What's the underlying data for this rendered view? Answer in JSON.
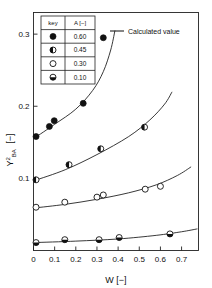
{
  "chart_data": {
    "type": "scatter",
    "title": "",
    "xlabel": "W  [−]",
    "ylabel": "Y²BA  [−]",
    "ylabel_base": "Y",
    "ylabel_sup": "2",
    "ylabel_sub": "BA",
    "ylabel_unit": "[−]",
    "xlim": [
      0,
      0.78
    ],
    "ylim": [
      0,
      0.33
    ],
    "xticks": [
      0,
      0.1,
      0.2,
      0.3,
      0.4,
      0.5,
      0.6,
      0.7
    ],
    "xtick_labels": [
      "0",
      "0.1",
      "0.2",
      "0.3",
      "0.4",
      "0.5",
      "0.6",
      "0.7"
    ],
    "yticks": [
      0.1,
      0.2,
      0.3
    ],
    "ytick_labels": [
      "0.1",
      "0.2",
      "0.3"
    ],
    "grid": false,
    "frame": true,
    "legend_position": "top-left",
    "series": [
      {
        "name": "A = 0.60",
        "key_label": "0.60",
        "marker": "filled-circle",
        "points": [
          {
            "x": 0.012,
            "y": 0.158
          },
          {
            "x": 0.075,
            "y": 0.172
          },
          {
            "x": 0.098,
            "y": 0.18
          },
          {
            "x": 0.235,
            "y": 0.204
          },
          {
            "x": 0.33,
            "y": 0.295
          }
        ],
        "curve": [
          {
            "x": 0.005,
            "y": 0.156
          },
          {
            "x": 0.1,
            "y": 0.175
          },
          {
            "x": 0.2,
            "y": 0.196
          },
          {
            "x": 0.28,
            "y": 0.222
          },
          {
            "x": 0.33,
            "y": 0.248
          },
          {
            "x": 0.365,
            "y": 0.278
          },
          {
            "x": 0.385,
            "y": 0.305
          }
        ]
      },
      {
        "name": "A = 0.45",
        "key_label": "0.45",
        "marker": "half-filled-circle",
        "points": [
          {
            "x": 0.012,
            "y": 0.098
          },
          {
            "x": 0.168,
            "y": 0.119
          },
          {
            "x": 0.318,
            "y": 0.141
          },
          {
            "x": 0.525,
            "y": 0.171
          }
        ],
        "curve": [
          {
            "x": 0.005,
            "y": 0.097
          },
          {
            "x": 0.15,
            "y": 0.112
          },
          {
            "x": 0.3,
            "y": 0.133
          },
          {
            "x": 0.45,
            "y": 0.158
          },
          {
            "x": 0.55,
            "y": 0.181
          },
          {
            "x": 0.62,
            "y": 0.203
          },
          {
            "x": 0.655,
            "y": 0.22
          }
        ]
      },
      {
        "name": "A = 0.30",
        "key_label": "0.30",
        "marker": "open-circle",
        "points": [
          {
            "x": 0.012,
            "y": 0.06
          },
          {
            "x": 0.148,
            "y": 0.067
          },
          {
            "x": 0.3,
            "y": 0.074
          },
          {
            "x": 0.33,
            "y": 0.077
          },
          {
            "x": 0.528,
            "y": 0.085
          },
          {
            "x": 0.6,
            "y": 0.089
          }
        ],
        "curve": [
          {
            "x": 0.005,
            "y": 0.059
          },
          {
            "x": 0.15,
            "y": 0.064
          },
          {
            "x": 0.3,
            "y": 0.071
          },
          {
            "x": 0.45,
            "y": 0.08
          },
          {
            "x": 0.58,
            "y": 0.091
          },
          {
            "x": 0.68,
            "y": 0.104
          },
          {
            "x": 0.745,
            "y": 0.116
          }
        ]
      },
      {
        "name": "A = 0.10",
        "key_label": "0.10",
        "marker": "bottom-half-filled-circle",
        "points": [
          {
            "x": 0.012,
            "y": 0.011
          },
          {
            "x": 0.148,
            "y": 0.015
          },
          {
            "x": 0.31,
            "y": 0.015
          },
          {
            "x": 0.405,
            "y": 0.018
          },
          {
            "x": 0.645,
            "y": 0.023
          }
        ],
        "curve": [
          {
            "x": 0.005,
            "y": 0.011
          },
          {
            "x": 0.2,
            "y": 0.013
          },
          {
            "x": 0.4,
            "y": 0.016
          },
          {
            "x": 0.58,
            "y": 0.021
          },
          {
            "x": 0.7,
            "y": 0.026
          },
          {
            "x": 0.775,
            "y": 0.03
          }
        ]
      }
    ],
    "legend_table": {
      "headers": [
        "key",
        "A [−]"
      ],
      "rows": [
        {
          "marker": "filled-circle",
          "value": "0.60"
        },
        {
          "marker": "half-filled-circle",
          "value": "0.45"
        },
        {
          "marker": "open-circle",
          "value": "0.30"
        },
        {
          "marker": "bottom-half-filled-circle",
          "value": "0.10"
        }
      ]
    },
    "curve_legend": {
      "label": "Calculated value",
      "line_color": "#222222"
    },
    "colors": {
      "axis": "#222222",
      "marker_fill": "#111111",
      "marker_edge": "#111111",
      "curve": "#222222",
      "background": "#ffffff"
    }
  }
}
